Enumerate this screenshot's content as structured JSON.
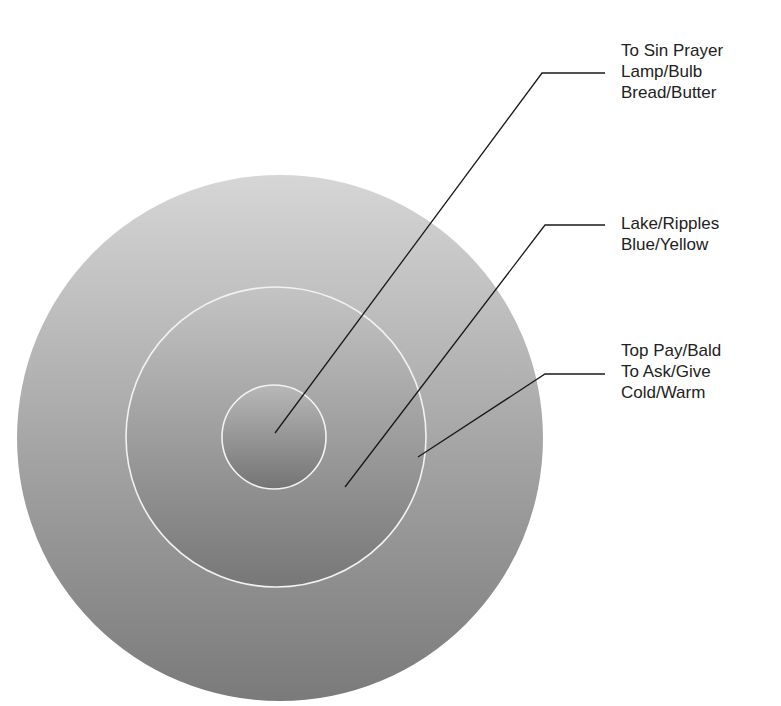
{
  "diagram": {
    "title": "",
    "colors": {
      "background": "#ffffff",
      "disc_light": "#d4d4d4",
      "disc_dark": "#7c7c7c",
      "ring_stroke": "#f2f2f2",
      "leader_line": "#1a1a1a",
      "text": "#222222"
    },
    "circles": [
      {
        "name": "outer",
        "cx": 280,
        "cy": 438,
        "r": 263
      },
      {
        "name": "middle",
        "cx": 276,
        "cy": 437,
        "r": 150
      },
      {
        "name": "inner",
        "cx": 274,
        "cy": 437,
        "r": 52
      }
    ],
    "labels": [
      {
        "target": "inner",
        "lines": [
          "To Sin Prayer",
          "Lamp/Bulb",
          "Bread/Butter"
        ]
      },
      {
        "target": "middle",
        "lines": [
          "Lake/Ripples",
          "Blue/Yellow"
        ]
      },
      {
        "target": "outer",
        "lines": [
          "Top Pay/Bald",
          "To Ask/Give",
          "Cold/Warm"
        ]
      }
    ]
  }
}
